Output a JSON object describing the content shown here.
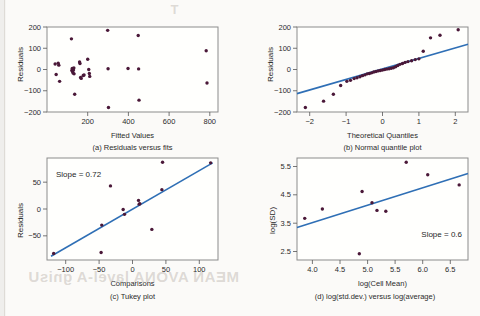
{
  "figure": {
    "background_color": "#fbfaf8",
    "point_color": "#4a1838",
    "line_color": "#2f6fb5",
    "axis_color": "#8b8b8b"
  },
  "bleed_through_text": {
    "line1": "MEAN AVONA lavel-A gnisU",
    "line2": "MAIN",
    "line3": "T"
  },
  "panels": [
    {
      "id": "a",
      "caption": "(a) Residuals versus fits",
      "xlabel": "Fitted Values",
      "ylabel": "Residuals"
    },
    {
      "id": "b",
      "caption": "(b) Normal quantile plot",
      "xlabel": "Theoretical Quantiles",
      "ylabel": "Residuals"
    },
    {
      "id": "c",
      "caption": "(c) Tukey plot",
      "xlabel": "Comparisons",
      "ylabel": "Residuals",
      "annotation": "Slope = 0.72"
    },
    {
      "id": "d",
      "caption": "(d) log(std.dev.) versus log(average)",
      "xlabel": "log(Cell Mean)",
      "ylabel": "log(SD)",
      "annotation": "Slope = 0.6"
    }
  ],
  "chart_data": [
    {
      "type": "scatter",
      "id": "a",
      "title": "(a) Residuals versus fits",
      "xlabel": "Fitted Values",
      "ylabel": "Residuals",
      "xlim": [
        0,
        840
      ],
      "ylim": [
        -215,
        215
      ],
      "xticks": [
        200,
        400,
        600,
        800
      ],
      "yticks": [
        -200,
        -100,
        0,
        100,
        200
      ],
      "grid": false,
      "legend": "none",
      "points": [
        [
          40,
          28
        ],
        [
          45,
          -25
        ],
        [
          55,
          32
        ],
        [
          58,
          22
        ],
        [
          62,
          -60
        ],
        [
          120,
          155
        ],
        [
          122,
          -5
        ],
        [
          124,
          5
        ],
        [
          126,
          -12
        ],
        [
          128,
          -18
        ],
        [
          130,
          -2
        ],
        [
          132,
          8
        ],
        [
          133,
          -22
        ],
        [
          136,
          -125
        ],
        [
          160,
          38
        ],
        [
          162,
          30
        ],
        [
          165,
          -40
        ],
        [
          168,
          -45
        ],
        [
          178,
          -30
        ],
        [
          182,
          -28
        ],
        [
          200,
          52
        ],
        [
          205,
          0
        ],
        [
          208,
          -20
        ],
        [
          210,
          -35
        ],
        [
          298,
          198
        ],
        [
          300,
          4
        ],
        [
          302,
          -192
        ],
        [
          398,
          5
        ],
        [
          448,
          172
        ],
        [
          450,
          3
        ],
        [
          452,
          -155
        ],
        [
          782,
          95
        ],
        [
          786,
          -68
        ]
      ]
    },
    {
      "type": "scatter",
      "id": "b",
      "title": "(b) Normal quantile plot",
      "xlabel": "Theoretical Quantiles",
      "ylabel": "Residuals",
      "xlim": [
        -2.35,
        2.35
      ],
      "ylim": [
        -215,
        215
      ],
      "xticks": [
        -2,
        -1,
        0,
        1,
        2
      ],
      "yticks": [
        -200,
        -100,
        0,
        100,
        200
      ],
      "grid": false,
      "legend": "none",
      "reference_line": {
        "x0": -2.35,
        "y0": -122,
        "x1": 2.35,
        "y1": 128
      },
      "points": [
        [
          -2.12,
          -192
        ],
        [
          -1.62,
          -160
        ],
        [
          -1.35,
          -125
        ],
        [
          -1.15,
          -81
        ],
        [
          -0.98,
          -60
        ],
        [
          -0.88,
          -55
        ],
        [
          -0.78,
          -46
        ],
        [
          -0.7,
          -42
        ],
        [
          -0.62,
          -37
        ],
        [
          -0.55,
          -31
        ],
        [
          -0.48,
          -27
        ],
        [
          -0.42,
          -22
        ],
        [
          -0.36,
          -20
        ],
        [
          -0.3,
          -17
        ],
        [
          -0.24,
          -13
        ],
        [
          -0.18,
          -10
        ],
        [
          -0.12,
          -7
        ],
        [
          -0.06,
          -5
        ],
        [
          0.0,
          -3
        ],
        [
          0.06,
          0
        ],
        [
          0.12,
          2
        ],
        [
          0.18,
          4
        ],
        [
          0.24,
          6
        ],
        [
          0.3,
          9
        ],
        [
          0.36,
          14
        ],
        [
          0.42,
          20
        ],
        [
          0.48,
          26
        ],
        [
          0.55,
          30
        ],
        [
          0.62,
          36
        ],
        [
          0.7,
          40
        ],
        [
          0.8,
          44
        ],
        [
          0.9,
          50
        ],
        [
          1.0,
          54
        ],
        [
          1.12,
          92
        ],
        [
          1.32,
          160
        ],
        [
          1.58,
          173
        ],
        [
          2.08,
          201
        ]
      ]
    },
    {
      "type": "scatter",
      "id": "c",
      "title": "(c) Tukey plot",
      "xlabel": "Comparisons",
      "ylabel": "Residuals",
      "xlim": [
        -128,
        128
      ],
      "ylim": [
        -95,
        95
      ],
      "xticks": [
        -100,
        -50,
        0,
        50,
        100
      ],
      "yticks": [
        -50,
        0,
        50
      ],
      "grid": false,
      "legend": "none",
      "annotation": "Slope = 0.72",
      "reference_line": {
        "x0": -122,
        "y0": -88,
        "x1": 120,
        "y1": 86
      },
      "points": [
        [
          -118,
          -83
        ],
        [
          -47,
          -81
        ],
        [
          -46,
          -30
        ],
        [
          -33,
          43
        ],
        [
          -14,
          -1
        ],
        [
          -12,
          -10
        ],
        [
          9,
          16
        ],
        [
          10,
          9
        ],
        [
          11,
          10
        ],
        [
          29,
          -38
        ],
        [
          44,
          36
        ],
        [
          45,
          87
        ],
        [
          117,
          86
        ]
      ]
    },
    {
      "type": "scatter",
      "id": "d",
      "title": "(d) log(std.dev.) versus log(average)",
      "xlabel": "log(Cell Mean)",
      "ylabel": "log(SD)",
      "xlim": [
        3.72,
        6.82
      ],
      "ylim": [
        2.2,
        5.8
      ],
      "xticks": [
        4.0,
        4.5,
        5.0,
        5.5,
        6.0,
        6.5
      ],
      "yticks": [
        2.5,
        3.5,
        4.5,
        5.5
      ],
      "grid": false,
      "legend": "none",
      "annotation": "Slope = 0.6",
      "reference_line": {
        "x0": 3.72,
        "y0": 3.35,
        "x1": 6.82,
        "y1": 5.25
      },
      "points": [
        [
          3.86,
          3.67
        ],
        [
          4.18,
          4.0
        ],
        [
          4.85,
          2.42
        ],
        [
          4.9,
          4.62
        ],
        [
          5.08,
          4.22
        ],
        [
          5.17,
          3.95
        ],
        [
          5.33,
          3.92
        ],
        [
          5.7,
          5.65
        ],
        [
          6.09,
          5.21
        ],
        [
          6.66,
          4.85
        ]
      ]
    }
  ]
}
